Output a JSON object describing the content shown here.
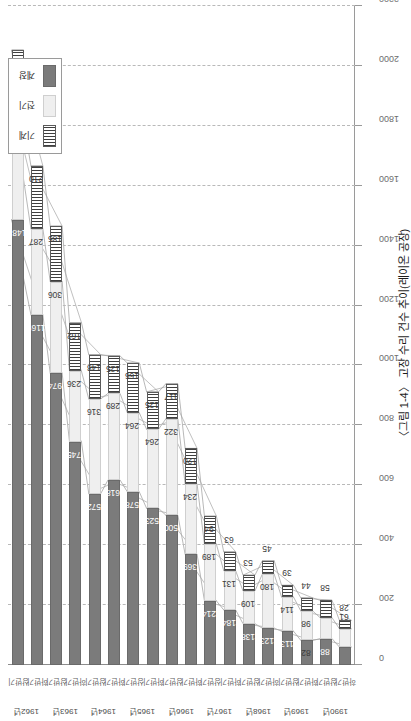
{
  "figure": {
    "title": "〈그림 1-4〉 고장 수리 건수 추이(레이온 공장)"
  },
  "legend": {
    "items": [
      {
        "label": "기계",
        "swatch": "hatched-vertical-lines",
        "color": "#3f3f3f"
      },
      {
        "label": "전기",
        "swatch": "light-gray-fill",
        "color": "#efefef"
      },
      {
        "label": "계장",
        "swatch": "dark-gray-fill",
        "color": "#7b7b7b"
      }
    ]
  },
  "axis": {
    "ylabel": "",
    "xlabel": "",
    "ticks": [
      0,
      200,
      400,
      600,
      800,
      1000,
      1200,
      1400,
      1600,
      1800,
      2000,
      2200
    ],
    "min": 0,
    "max": 2200,
    "step": 200
  },
  "half_labels": {
    "first": "상반기",
    "second": "하반기"
  },
  "chart_data": {
    "type": "bar",
    "orientation": "horizontal-stacked",
    "title": "〈그림 1-4〉 고장 수리 건수 추이(레이온 공장)",
    "xlabel": "",
    "ylabel": "",
    "ylim": [
      0,
      2200
    ],
    "grid": true,
    "legend_position": "top-left",
    "categories": [
      "1962년 상반기",
      "1962년 하반기",
      "1963년 상반기",
      "1963년 하반기",
      "1964년 상반기",
      "1964년 하반기",
      "1965년 상반기",
      "1965년 하반기",
      "1966년 상반기",
      "1966년 하반기",
      "1967년 상반기",
      "1967년 하반기",
      "1968년 상반기",
      "1968년 하반기",
      "1969년 상반기",
      "1969년 하반기",
      "1990년 상반기",
      "1990년 하반기"
    ],
    "groups": [
      {
        "year": "1962년",
        "halves": [
          "상반기",
          "하반기"
        ]
      },
      {
        "year": "1963년",
        "halves": [
          "상반기",
          "하반기"
        ]
      },
      {
        "year": "1964년",
        "halves": [
          "상반기",
          "하반기"
        ]
      },
      {
        "year": "1965년",
        "halves": [
          "상반기",
          "하반기"
        ]
      },
      {
        "year": "1966년",
        "halves": [
          "상반기",
          "하반기"
        ]
      },
      {
        "year": "1967년",
        "halves": [
          "상반기",
          "하반기"
        ]
      },
      {
        "year": "1968년",
        "halves": [
          "상반기",
          "하반기"
        ]
      },
      {
        "year": "1969년",
        "halves": [
          "상반기",
          "하반기"
        ]
      },
      {
        "year": "1990년",
        "halves": [
          "상반기",
          "하반기"
        ]
      }
    ],
    "series": [
      {
        "name": "계장",
        "color": "#7b7b7b",
        "values": [
          1487,
          1169,
          974,
          745,
          572,
          618,
          578,
          523,
          500,
          369,
          214,
          184,
          138,
          123,
          113,
          82,
          88,
          60
        ]
      },
      {
        "name": "전기",
        "color": "#efefef",
        "values": [
          401,
          287,
          306,
          236,
          316,
          289,
          264,
          264,
          322,
          234,
          189,
          131,
          109,
          180,
          114,
          98,
          70,
          61
        ]
      },
      {
        "name": "기계",
        "color": "#3f3f3f",
        "values": [
          165,
          210,
          185,
          162,
          148,
          125,
          166,
          125,
          117,
          120,
          94,
          63,
          53,
          45,
          39,
          44,
          58,
          28
        ]
      }
    ]
  }
}
